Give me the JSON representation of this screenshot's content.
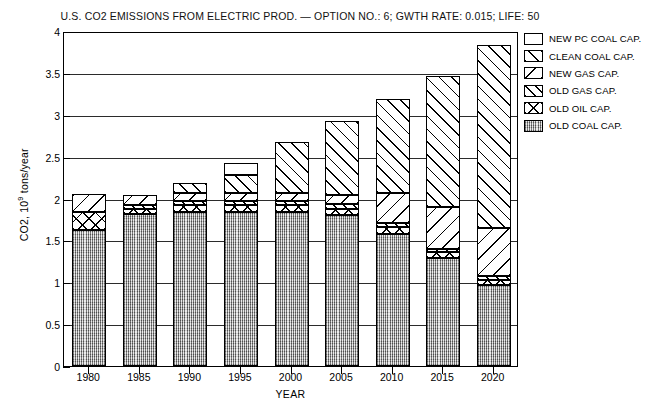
{
  "chart_data": {
    "type": "bar",
    "stacked": true,
    "title": "U.S. CO2 EMISSIONS FROM ELECTRIC PROD. — OPTION NO.: 6; GWTH RATE: 0.015; LIFE: 50",
    "xlabel": "YEAR",
    "ylabel": "CO2, 10^9 tons/year",
    "ylim": [
      0,
      4
    ],
    "yticks": [
      "0",
      "0.5",
      "1",
      "1.5",
      "2",
      "2.5",
      "3",
      "3.5",
      "4"
    ],
    "ytick_values": [
      0,
      0.5,
      1,
      1.5,
      2,
      2.5,
      3,
      3.5,
      4
    ],
    "grid": true,
    "legend_position": "right-top",
    "categories": [
      "1980",
      "1985",
      "1990",
      "1995",
      "2000",
      "2005",
      "2010",
      "2015",
      "2020"
    ],
    "series": [
      {
        "name": "OLD COAL CAP.",
        "pattern": "stipple-gray",
        "values": [
          1.62,
          1.82,
          1.84,
          1.84,
          1.84,
          1.8,
          1.58,
          1.29,
          0.97
        ]
      },
      {
        "name": "OLD OIL CAP.",
        "pattern": "cross-hatch",
        "values": [
          0.22,
          0.06,
          0.08,
          0.08,
          0.08,
          0.08,
          0.08,
          0.07,
          0.06
        ]
      },
      {
        "name": "OLD GAS CAP.",
        "pattern": "diagonal-up-fine",
        "values": [
          0.0,
          0.04,
          0.05,
          0.05,
          0.05,
          0.05,
          0.05,
          0.04,
          0.04
        ]
      },
      {
        "name": "NEW GAS CAP.",
        "pattern": "diagonal-down",
        "values": [
          0.21,
          0.12,
          0.1,
          0.09,
          0.09,
          0.11,
          0.35,
          0.5,
          0.58
        ]
      },
      {
        "name": "CLEAN COAL CAP.",
        "pattern": "diagonal-up",
        "values": [
          0.0,
          0.0,
          0.12,
          0.22,
          0.61,
          0.89,
          1.13,
          1.56,
          2.18
        ]
      },
      {
        "name": "NEW PC COAL CAP.",
        "pattern": "blank-white",
        "values": [
          0.0,
          0.0,
          0.0,
          0.15,
          0.0,
          0.0,
          0.0,
          0.0,
          0.0
        ]
      }
    ],
    "totals": [
      2.05,
      2.04,
      2.19,
      2.43,
      2.67,
      2.93,
      3.19,
      3.46,
      3.83
    ]
  },
  "legend": {
    "items": [
      {
        "label": "NEW PC COAL CAP."
      },
      {
        "label": "CLEAN COAL CAP."
      },
      {
        "label": "NEW GAS CAP."
      },
      {
        "label": "OLD GAS CAP."
      },
      {
        "label": "OLD OIL CAP."
      },
      {
        "label": "OLD COAL CAP."
      }
    ]
  },
  "axis": {
    "y_title_main": "CO2, 10",
    "y_title_sup": "9",
    "y_title_tail": " tons/year"
  }
}
